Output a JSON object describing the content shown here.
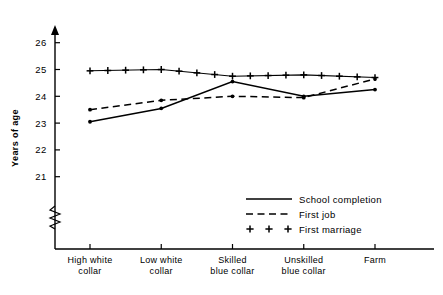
{
  "chart_data": {
    "type": "line",
    "title": "",
    "xlabel": "",
    "ylabel": "Years of age",
    "categories": [
      "High white collar",
      "Low white collar",
      "Skilled blue collar",
      "Unskilled blue collar",
      "Farm"
    ],
    "category_lines": [
      [
        "High white",
        "collar"
      ],
      [
        "Low white",
        "collar"
      ],
      [
        "Skilled",
        "blue collar"
      ],
      [
        "Unskilled",
        "blue collar"
      ],
      [
        "Farm",
        ""
      ]
    ],
    "ylim": [
      20.6,
      26.4
    ],
    "yticks": [
      21,
      22,
      23,
      24,
      25,
      26
    ],
    "ytick_labels": [
      "21",
      "22",
      "23",
      "24",
      "25",
      "26"
    ],
    "grid": false,
    "axis_break": true,
    "legend_position": "inside-bottom-right",
    "series": [
      {
        "name": "School completion",
        "style": "solid",
        "marker": "dot",
        "values": [
          23.05,
          23.55,
          24.55,
          24.0,
          24.25
        ]
      },
      {
        "name": "First job",
        "style": "dashed",
        "marker": "dot",
        "values": [
          23.5,
          23.85,
          24.0,
          23.95,
          24.65
        ]
      },
      {
        "name": "First marriage",
        "style": "plus",
        "marker": "plus",
        "values": [
          24.95,
          25.0,
          24.75,
          24.8,
          24.7
        ]
      }
    ]
  },
  "legend": {
    "items": [
      {
        "label": "School completion",
        "style": "solid"
      },
      {
        "label": "First job",
        "style": "dashed"
      },
      {
        "label": "First marriage",
        "style": "plus"
      }
    ]
  },
  "colors": {
    "ink": "#000000",
    "background": "#ffffff"
  }
}
